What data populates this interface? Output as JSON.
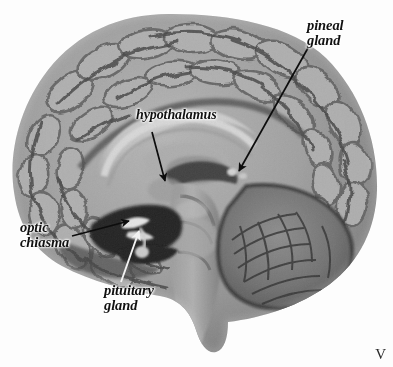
{
  "figure": {
    "kind": "anatomical-photograph",
    "palette": "grayscale",
    "background_color": "#fdfdfd",
    "label_color": "#111111",
    "arrow_dark_color": "#0d0d0d",
    "arrow_light_color": "#f2f2f2",
    "corner_mark": "V"
  },
  "labels": {
    "pineal": {
      "line1": "pineal",
      "line2": "gland"
    },
    "hypothalamus": {
      "line1": "hypothalamus"
    },
    "optic": {
      "line1": "optic",
      "line2": "chiasma"
    },
    "pituitary": {
      "line1": "pituitary",
      "line2": "gland"
    }
  }
}
